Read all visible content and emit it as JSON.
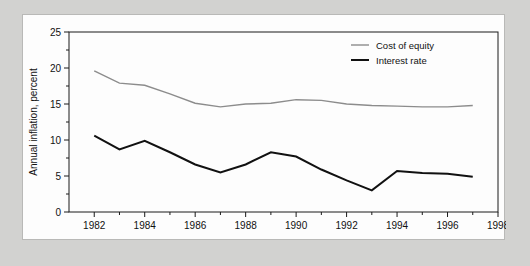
{
  "chart_data": {
    "type": "line",
    "title": "",
    "xlabel": "",
    "ylabel": "Annual inflation, percent",
    "xlim": [
      1981,
      1998
    ],
    "ylim": [
      0,
      25
    ],
    "grid": false,
    "legend_position": "top-right",
    "x_tick_labels": [
      "1982",
      "1984",
      "1986",
      "1988",
      "1990",
      "1992",
      "1994",
      "1996",
      "1998"
    ],
    "x_tick_values": [
      1982,
      1984,
      1986,
      1988,
      1990,
      1992,
      1994,
      1996,
      1998
    ],
    "x_minor_ticks": [
      1983,
      1985,
      1987,
      1989,
      1991,
      1993,
      1995,
      1997
    ],
    "y_tick_labels": [
      "0",
      "5",
      "10",
      "15",
      "20",
      "25"
    ],
    "y_tick_values": [
      0,
      5,
      10,
      15,
      20,
      25
    ],
    "y_minor_ticks": [
      2.5,
      7.5,
      12.5,
      17.5,
      22.5
    ],
    "x": [
      1982,
      1983,
      1984,
      1985,
      1986,
      1987,
      1988,
      1989,
      1990,
      1991,
      1992,
      1993,
      1994,
      1995,
      1996,
      1997
    ],
    "series": [
      {
        "name": "Cost of equity",
        "color": "#8c8c8c",
        "width": 1.4,
        "values": [
          19.6,
          17.9,
          17.6,
          16.4,
          15.1,
          14.6,
          15.0,
          15.1,
          15.6,
          15.5,
          15.0,
          14.8,
          14.7,
          14.6,
          14.6,
          14.8
        ]
      },
      {
        "name": "Interest rate",
        "color": "#111111",
        "width": 2.0,
        "values": [
          10.6,
          8.7,
          9.9,
          8.3,
          6.6,
          5.5,
          6.6,
          8.3,
          7.7,
          5.9,
          4.4,
          3.0,
          5.7,
          5.4,
          5.3,
          4.9
        ]
      }
    ]
  },
  "legend": {
    "items": [
      {
        "label": "Cost of equity"
      },
      {
        "label": "Interest rate"
      }
    ]
  },
  "axes": {
    "y_title": "Annual inflation, percent"
  }
}
